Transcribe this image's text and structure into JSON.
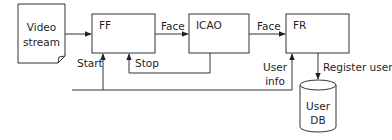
{
  "diagram": {
    "nodes": {
      "video_stream": {
        "label_line1": "Video",
        "label_line2": "stream",
        "shape": "document"
      },
      "ff": {
        "label": "FF",
        "shape": "process-box"
      },
      "icao": {
        "label": "ICAO",
        "shape": "process-box"
      },
      "fr": {
        "label": "FR",
        "shape": "process-box"
      },
      "user_db": {
        "label_line1": "User",
        "label_line2": "DB",
        "shape": "database-cylinder"
      }
    },
    "edges": {
      "video_to_ff": {
        "label": ""
      },
      "ff_to_icao": {
        "label": "Face"
      },
      "icao_to_fr": {
        "label": "Face"
      },
      "start": {
        "label": "Start"
      },
      "stop": {
        "label": "Stop"
      },
      "user_info": {
        "label_line1": "User",
        "label_line2": "info"
      },
      "register_user": {
        "label": "Register user"
      }
    },
    "colors": {
      "stroke": "#333333",
      "text": "#1e1e1e",
      "background": "#ffffff"
    }
  }
}
